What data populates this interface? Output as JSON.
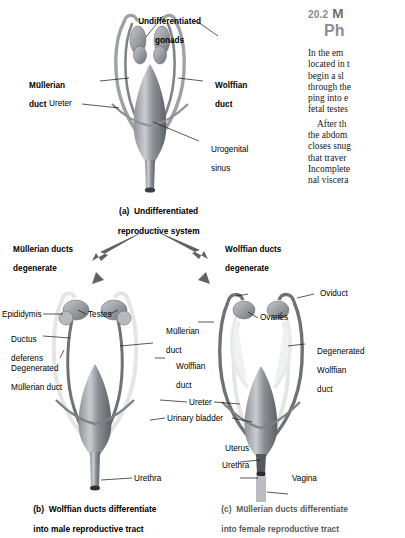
{
  "figure": {
    "panel_a": {
      "caption_line1": "(a)  Undifferentiated",
      "caption_line2": "reproductive system",
      "labels": {
        "gonads_l1": "Undifferentiated",
        "gonads_l2": "gonads",
        "mullerian_l1": "Müllerian",
        "mullerian_l2": "duct",
        "wolffian_l1": "Wolffian",
        "wolffian_l2": "duct",
        "ureter": "Ureter",
        "urogenital_l1": "Urogenital",
        "urogenital_l2": "sinus"
      }
    },
    "arrows": {
      "left_l1": "Müllerian ducts",
      "left_l2": "degenerate",
      "right_l1": "Wolffian ducts",
      "right_l2": "degenerate"
    },
    "panel_b": {
      "caption_line1": "(b)  Wolffian ducts differentiate",
      "caption_line2": "into male reproductive tract",
      "labels": {
        "epididymis": "Epididymis",
        "ductus_l1": "Ductus",
        "ductus_l2": "deferens",
        "degen_l1": "Degenerated",
        "degen_l2": "Müllerian duct",
        "testes": "Testes",
        "urethra": "Urethra"
      }
    },
    "panel_c": {
      "caption_line1": "(c)  Müllerian ducts differentiate",
      "caption_line2": "into female reproductive tract",
      "labels": {
        "oviduct": "Oviduct",
        "ovaries": "Ovaries",
        "degen_l1": "Degenerated",
        "degen_l2": "Wolffian",
        "degen_l3": "duct",
        "uterus": "Uterus",
        "urethra": "Urethra",
        "vagina": "Vagina"
      }
    },
    "shared_labels": {
      "mullerian_l1": "Müllerian",
      "mullerian_l2": "duct",
      "wolffian_l1": "Wolffian",
      "wolffian_l2": "duct",
      "ureter": "Ureter",
      "urinary_bladder": "Urinary bladder"
    }
  },
  "textcolumn": {
    "section_number": "20.2",
    "heading_line1": "M",
    "heading_line2": "Ph",
    "paragraph1": [
      "In  the  em",
      "located in t",
      "begin  a  sl",
      "through the",
      "ping into e",
      "fetal testes"
    ],
    "paragraph2": [
      "After th",
      "the abdom",
      "closes snug",
      "that  traver",
      "Incomplete",
      "nal viscera"
    ]
  },
  "colors": {
    "duct_dark": "#6f7276",
    "duct_light": "#d3d5d8",
    "organ_grey": "#9a9ea3",
    "arrow": "#5f6367",
    "caption_grey": "#5b5b5b"
  }
}
